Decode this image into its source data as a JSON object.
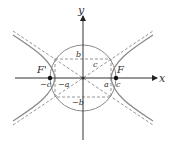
{
  "diagram": {
    "colors": {
      "curve": "#8a8a8a",
      "axis": "#333333",
      "dashed": "#8a8a8a",
      "focus": "#111111",
      "background": "#ffffff"
    },
    "axes": {
      "x_label": "x",
      "y_label": "y"
    },
    "foci": {
      "right_label": "F",
      "left_label": "F'"
    },
    "labels": {
      "c_right": "c",
      "c_left": "−c",
      "a_right": "a",
      "a_left": "−a",
      "b_top": "b",
      "b_bottom": "−b",
      "c_diagonal": "c"
    },
    "geometry": {
      "center": [
        83,
        78
      ],
      "a": 28,
      "b": 19,
      "c": 33,
      "circle_radius": 33
    }
  }
}
